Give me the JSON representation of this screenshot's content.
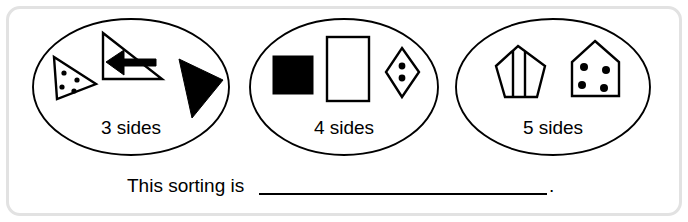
{
  "worksheet": {
    "prompt_prefix": "This sorting is",
    "prompt_blank": "",
    "prompt_suffix": ".",
    "border_color": "#e2e2e2",
    "ink_color": "#000000",
    "background_color": "#ffffff"
  },
  "groups": [
    {
      "label": "3 sides",
      "shapes": [
        {
          "name": "triangle-with-four-dots",
          "fill": "outline",
          "dots": 4
        },
        {
          "name": "right-triangle-with-left-arrow",
          "fill": "outline",
          "dots": 0
        },
        {
          "name": "solid-black-triangle",
          "fill": "solid",
          "dots": 0
        }
      ]
    },
    {
      "label": "4 sides",
      "shapes": [
        {
          "name": "solid-black-square",
          "fill": "solid",
          "dots": 0
        },
        {
          "name": "open-rectangle",
          "fill": "outline",
          "dots": 0
        },
        {
          "name": "rhombus-with-two-dots",
          "fill": "outline",
          "dots": 2
        }
      ]
    },
    {
      "label": "5 sides",
      "shapes": [
        {
          "name": "striped-pentagon",
          "fill": "outline",
          "dots": 0
        },
        {
          "name": "house-pentagon-with-four-dots",
          "fill": "outline",
          "dots": 4
        }
      ]
    }
  ]
}
